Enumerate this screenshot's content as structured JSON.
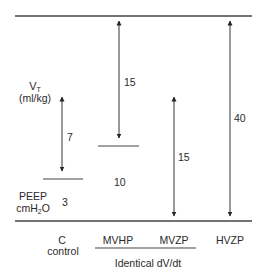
{
  "diagram": {
    "axis_left": {
      "vt_label": "V",
      "vt_sub": "T",
      "vt_units": "(ml/kg)",
      "peep_label": "PEEP",
      "peep_units_pre": "cmH",
      "peep_units_sub": "2",
      "peep_units_post": "O"
    },
    "groups": [
      {
        "name": "C",
        "sub": "control",
        "peep": "3",
        "vt": "7"
      },
      {
        "name": "MVHP",
        "peep": "10",
        "vt": "15"
      },
      {
        "name": "MVZP",
        "peep": "",
        "vt": "15"
      },
      {
        "name": "HVZP",
        "peep": "",
        "vt": "40"
      }
    ],
    "bracket_label": "Identical dV/dt"
  }
}
